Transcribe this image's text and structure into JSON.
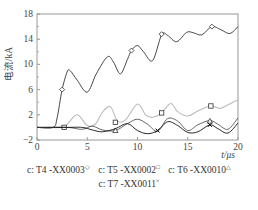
{
  "chart_data": {
    "type": "line",
    "title": "",
    "xlabel": "t/μs",
    "ylabel": "电流/kA",
    "xlim": [
      0,
      20
    ],
    "ylim": [
      -2,
      18
    ],
    "xticks": [
      0,
      5,
      10,
      15,
      20
    ],
    "yticks": [
      -2,
      2,
      6,
      10,
      14,
      18
    ],
    "grid": false,
    "legend_position": "bottom",
    "series": [
      {
        "name": "c: T4 -XX0003",
        "marker": "diamond",
        "color": "#333333",
        "x": [
          0,
          1.6,
          2.0,
          2.5,
          3.0,
          3.3,
          4.0,
          5.0,
          5.9,
          7.0,
          7.6,
          8.3,
          9.0,
          9.4,
          10.0,
          10.6,
          11.5,
          12.4,
          13.0,
          13.9,
          14.9,
          15.6,
          16.4,
          17.4,
          18.3,
          19.2,
          20.0
        ],
        "y": [
          0,
          0,
          1.5,
          6.0,
          8.8,
          9.0,
          7.5,
          5.6,
          8.5,
          11.2,
          10.4,
          8.5,
          10.8,
          12.2,
          13.0,
          12.0,
          10.6,
          14.7,
          14.6,
          13.6,
          15.1,
          15.0,
          14.7,
          16.0,
          15.5,
          14.9,
          16.0
        ],
        "markers_x": [
          2.5,
          9.4,
          12.4,
          17.4
        ],
        "markers_y": [
          6.0,
          12.2,
          14.8,
          16.0
        ]
      },
      {
        "name": "c: T5 -XX0002",
        "marker": "square",
        "color": "#bbbbbb",
        "x": [
          0,
          2.4,
          3.0,
          4.0,
          5.0,
          5.8,
          6.5,
          7.3,
          8.0,
          8.8,
          10.0,
          10.8,
          11.5,
          12.4,
          13.3,
          14.0,
          15.0,
          16.0,
          17.3,
          18.2,
          19.0,
          20.0
        ],
        "y": [
          0,
          0,
          0.5,
          2.0,
          0.3,
          0.5,
          2.4,
          3.3,
          1.0,
          1.2,
          3.7,
          2.0,
          1.6,
          2.3,
          3.8,
          2.5,
          1.8,
          2.6,
          3.4,
          3.0,
          3.6,
          4.4
        ],
        "markers_x": [
          2.7,
          7.8,
          12.4,
          17.3
        ],
        "markers_y": [
          0,
          0.8,
          2.3,
          3.4
        ]
      },
      {
        "name": "c: T6 -XX0010",
        "marker": "triangle",
        "color": "#555555",
        "x": [
          0,
          3.0,
          4.5,
          5.5,
          6.5,
          7.8,
          9.0,
          10.0,
          11.0,
          12.0,
          13.0,
          14.0,
          15.0,
          16.0,
          17.2,
          18.0,
          19.0,
          20.0
        ],
        "y": [
          0,
          0,
          -0.3,
          0.2,
          -0.4,
          -0.5,
          0.6,
          1.3,
          0.5,
          -0.6,
          1.4,
          1.0,
          -0.5,
          0.4,
          1.1,
          0.5,
          -0.3,
          1.5
        ],
        "markers_x": [
          7.8,
          17.2
        ],
        "markers_y": [
          -0.5,
          1.0
        ]
      },
      {
        "name": "c: T7 -XX0011",
        "marker": "x",
        "color": "#111111",
        "x": [
          0,
          3.0,
          4.5,
          5.5,
          6.5,
          7.8,
          9.0,
          10.0,
          11.0,
          12.0,
          13.0,
          14.0,
          15.0,
          16.0,
          17.2,
          18.0,
          19.0,
          20.0
        ],
        "y": [
          0,
          0,
          0,
          -0.4,
          -0.7,
          -0.2,
          0.6,
          -0.5,
          -1.0,
          -0.5,
          0.9,
          0.3,
          -0.8,
          -0.7,
          0.4,
          -0.2,
          -0.9,
          0.7
        ],
        "markers_x": [
          12.0,
          17.2
        ],
        "markers_y": [
          -0.5,
          0.4
        ]
      }
    ],
    "legend": [
      {
        "label": "c: T4 -XX0003",
        "symbol": "◇"
      },
      {
        "label": "c: T5 -XX0002",
        "symbol": "□"
      },
      {
        "label": "c: T6 -XX0010",
        "symbol": "△"
      },
      {
        "label": "c: T7 -XX0011",
        "symbol": "×"
      }
    ]
  }
}
